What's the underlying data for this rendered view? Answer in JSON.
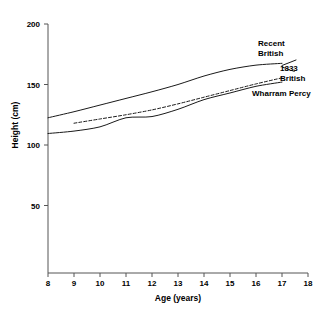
{
  "chart_data": {
    "type": "line",
    "title": "",
    "xlabel": "Age (years)",
    "ylabel": "Height (cm)",
    "xlim": [
      8,
      18
    ],
    "ylim": [
      0,
      200
    ],
    "xticks": [
      8,
      9,
      10,
      11,
      12,
      13,
      14,
      15,
      16,
      17,
      18
    ],
    "yticks": [
      50,
      100,
      150,
      200
    ],
    "grid": false,
    "legend_position": "inline-right",
    "series": [
      {
        "name": "Recent British",
        "style": "solid",
        "label_line1": "Recent",
        "label_line2": "British",
        "x": [
          8,
          9,
          10,
          11,
          12,
          13,
          14,
          15,
          16,
          17
        ],
        "values": [
          122.5,
          127.5,
          133.0,
          138.5,
          144.0,
          150.0,
          157.0,
          162.5,
          166.0,
          167.5
        ]
      },
      {
        "name": "1833 British",
        "style": "dashed",
        "label_line1": "1833",
        "label_line2": "British",
        "x": [
          9,
          10,
          11,
          12,
          13,
          14,
          15,
          16,
          17
        ],
        "values": [
          118.0,
          121.5,
          125.0,
          129.0,
          134.0,
          139.5,
          145.0,
          150.5,
          155.5
        ]
      },
      {
        "name": "Wharram Percy",
        "style": "solid",
        "label_line1": "Wharram Percy",
        "label_line2": "",
        "x": [
          8,
          9,
          10,
          11,
          12,
          13,
          14,
          15,
          16,
          17
        ],
        "values": [
          109.5,
          111.5,
          115.0,
          122.5,
          123.5,
          129.5,
          137.5,
          143.0,
          148.5,
          152.0
        ]
      }
    ]
  },
  "axis": {
    "x_label": "Age (years)",
    "y_label": "Height (cm)",
    "x_tick_labels": [
      "8",
      "9",
      "10",
      "11",
      "12",
      "13",
      "14",
      "15",
      "16",
      "17",
      "18"
    ],
    "y_tick_labels": [
      "200",
      "150",
      "100",
      "50"
    ]
  },
  "labels": {
    "recent_british_1": "Recent",
    "recent_british_2": "British",
    "british_1833_1": "1833",
    "british_1833_2": "British",
    "wharram_percy": "Wharram Percy"
  },
  "colors": {
    "line": "#1a1a1a",
    "axis": "#555555",
    "background": "#ffffff"
  }
}
